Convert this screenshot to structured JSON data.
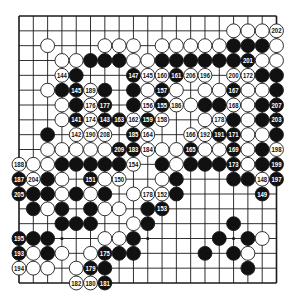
{
  "diagram": {
    "type": "go-board-kifu",
    "size": 19,
    "colors": {
      "board": "#ffffff",
      "line": "#1a1a1a",
      "black": "#111111",
      "white": "#ffffff"
    },
    "star_points": [
      [
        3,
        3
      ],
      [
        3,
        9
      ],
      [
        3,
        15
      ],
      [
        9,
        3
      ],
      [
        9,
        9
      ],
      [
        9,
        15
      ],
      [
        15,
        3
      ],
      [
        15,
        9
      ],
      [
        15,
        15
      ]
    ],
    "stones": [
      {
        "r": 1,
        "c": 15,
        "color": "W"
      },
      {
        "r": 1,
        "c": 16,
        "color": "W"
      },
      {
        "r": 1,
        "c": 17,
        "color": "W"
      },
      {
        "r": 1,
        "c": 18,
        "color": "W",
        "n": "202"
      },
      {
        "r": 2,
        "c": 2,
        "color": "W"
      },
      {
        "r": 2,
        "c": 6,
        "color": "W"
      },
      {
        "r": 2,
        "c": 7,
        "color": "W"
      },
      {
        "r": 2,
        "c": 8,
        "color": "W"
      },
      {
        "r": 2,
        "c": 10,
        "color": "W"
      },
      {
        "r": 2,
        "c": 11,
        "color": "W"
      },
      {
        "r": 2,
        "c": 12,
        "color": "W"
      },
      {
        "r": 2,
        "c": 13,
        "color": "W"
      },
      {
        "r": 2,
        "c": 14,
        "color": "W"
      },
      {
        "r": 2,
        "c": 15,
        "color": "B"
      },
      {
        "r": 2,
        "c": 16,
        "color": "B"
      },
      {
        "r": 2,
        "c": 17,
        "color": "B"
      },
      {
        "r": 2,
        "c": 18,
        "color": "W"
      },
      {
        "r": 3,
        "c": 3,
        "color": "W"
      },
      {
        "r": 3,
        "c": 4,
        "color": "W"
      },
      {
        "r": 3,
        "c": 5,
        "color": "B"
      },
      {
        "r": 3,
        "c": 6,
        "color": "B"
      },
      {
        "r": 3,
        "c": 7,
        "color": "B"
      },
      {
        "r": 3,
        "c": 8,
        "color": "W"
      },
      {
        "r": 3,
        "c": 9,
        "color": "W"
      },
      {
        "r": 3,
        "c": 10,
        "color": "B"
      },
      {
        "r": 3,
        "c": 11,
        "color": "B"
      },
      {
        "r": 3,
        "c": 12,
        "color": "B"
      },
      {
        "r": 3,
        "c": 13,
        "color": "B"
      },
      {
        "r": 3,
        "c": 14,
        "color": "B"
      },
      {
        "r": 3,
        "c": 15,
        "color": "B"
      },
      {
        "r": 3,
        "c": 16,
        "color": "B",
        "n": "201"
      },
      {
        "r": 3,
        "c": 17,
        "color": "W"
      },
      {
        "r": 3,
        "c": 18,
        "color": "W"
      },
      {
        "r": 4,
        "c": 3,
        "color": "W",
        "n": "144"
      },
      {
        "r": 4,
        "c": 4,
        "color": "B"
      },
      {
        "r": 4,
        "c": 8,
        "color": "B",
        "n": "147"
      },
      {
        "r": 4,
        "c": 9,
        "color": "W",
        "n": "145"
      },
      {
        "r": 4,
        "c": 10,
        "color": "W",
        "n": "160"
      },
      {
        "r": 4,
        "c": 11,
        "color": "B",
        "n": "161"
      },
      {
        "r": 4,
        "c": 12,
        "color": "W",
        "n": "206"
      },
      {
        "r": 4,
        "c": 13,
        "color": "W",
        "n": "196"
      },
      {
        "r": 4,
        "c": 15,
        "color": "W",
        "n": "200"
      },
      {
        "r": 4,
        "c": 16,
        "color": "W",
        "n": "172"
      },
      {
        "r": 4,
        "c": 17,
        "color": "B"
      },
      {
        "r": 4,
        "c": 18,
        "color": "B"
      },
      {
        "r": 5,
        "c": 2,
        "color": "W"
      },
      {
        "r": 5,
        "c": 3,
        "color": "B"
      },
      {
        "r": 5,
        "c": 4,
        "color": "B",
        "n": "145"
      },
      {
        "r": 5,
        "c": 5,
        "color": "W",
        "n": "189"
      },
      {
        "r": 5,
        "c": 6,
        "color": "B"
      },
      {
        "r": 5,
        "c": 8,
        "color": "B"
      },
      {
        "r": 5,
        "c": 9,
        "color": "W"
      },
      {
        "r": 5,
        "c": 10,
        "color": "B",
        "n": "157"
      },
      {
        "r": 5,
        "c": 11,
        "color": "W"
      },
      {
        "r": 5,
        "c": 13,
        "color": "W"
      },
      {
        "r": 5,
        "c": 14,
        "color": "W"
      },
      {
        "r": 5,
        "c": 15,
        "color": "B",
        "n": "167"
      },
      {
        "r": 5,
        "c": 16,
        "color": "W"
      },
      {
        "r": 5,
        "c": 17,
        "color": "W"
      },
      {
        "r": 5,
        "c": 18,
        "color": "B"
      },
      {
        "r": 6,
        "c": 3,
        "color": "W"
      },
      {
        "r": 6,
        "c": 4,
        "color": "B"
      },
      {
        "r": 6,
        "c": 5,
        "color": "W",
        "n": "176"
      },
      {
        "r": 6,
        "c": 6,
        "color": "B",
        "n": "177"
      },
      {
        "r": 6,
        "c": 8,
        "color": "B"
      },
      {
        "r": 6,
        "c": 9,
        "color": "W",
        "n": "156"
      },
      {
        "r": 6,
        "c": 10,
        "color": "B",
        "n": "155"
      },
      {
        "r": 6,
        "c": 11,
        "color": "W",
        "n": "186"
      },
      {
        "r": 6,
        "c": 12,
        "color": "W"
      },
      {
        "r": 6,
        "c": 13,
        "color": "B"
      },
      {
        "r": 6,
        "c": 14,
        "color": "B"
      },
      {
        "r": 6,
        "c": 15,
        "color": "W",
        "n": "168"
      },
      {
        "r": 6,
        "c": 16,
        "color": "W"
      },
      {
        "r": 6,
        "c": 17,
        "color": "B"
      },
      {
        "r": 6,
        "c": 18,
        "color": "B",
        "n": "207"
      },
      {
        "r": 7,
        "c": 3,
        "color": "W"
      },
      {
        "r": 7,
        "c": 4,
        "color": "B",
        "n": "141"
      },
      {
        "r": 7,
        "c": 5,
        "color": "W",
        "n": "174"
      },
      {
        "r": 7,
        "c": 6,
        "color": "B",
        "n": "143"
      },
      {
        "r": 7,
        "c": 7,
        "color": "B",
        "n": "163"
      },
      {
        "r": 7,
        "c": 8,
        "color": "W",
        "n": "162"
      },
      {
        "r": 7,
        "c": 9,
        "color": "B",
        "n": "159"
      },
      {
        "r": 7,
        "c": 10,
        "color": "W",
        "n": "158"
      },
      {
        "r": 7,
        "c": 13,
        "color": "W"
      },
      {
        "r": 7,
        "c": 14,
        "color": "W",
        "n": "178"
      },
      {
        "r": 7,
        "c": 15,
        "color": "B"
      },
      {
        "r": 7,
        "c": 16,
        "color": "W"
      },
      {
        "r": 7,
        "c": 17,
        "color": "B"
      },
      {
        "r": 7,
        "c": 18,
        "color": "B",
        "n": "203"
      },
      {
        "r": 8,
        "c": 2,
        "color": "B"
      },
      {
        "r": 8,
        "c": 4,
        "color": "W",
        "n": "142"
      },
      {
        "r": 8,
        "c": 5,
        "color": "W",
        "n": "190"
      },
      {
        "r": 8,
        "c": 6,
        "color": "W",
        "n": "208"
      },
      {
        "r": 8,
        "c": 8,
        "color": "B",
        "n": "185"
      },
      {
        "r": 8,
        "c": 9,
        "color": "W",
        "n": "164"
      },
      {
        "r": 8,
        "c": 12,
        "color": "W",
        "n": "166"
      },
      {
        "r": 8,
        "c": 13,
        "color": "W",
        "n": "192"
      },
      {
        "r": 8,
        "c": 14,
        "color": "B",
        "n": "191"
      },
      {
        "r": 8,
        "c": 15,
        "color": "B",
        "n": "171"
      },
      {
        "r": 8,
        "c": 16,
        "color": "W"
      },
      {
        "r": 8,
        "c": 17,
        "color": "W"
      },
      {
        "r": 8,
        "c": 18,
        "color": "B"
      },
      {
        "r": 9,
        "c": 2,
        "color": "W"
      },
      {
        "r": 9,
        "c": 3,
        "color": "W"
      },
      {
        "r": 9,
        "c": 4,
        "color": "W"
      },
      {
        "r": 9,
        "c": 5,
        "color": "W"
      },
      {
        "r": 9,
        "c": 6,
        "color": "W"
      },
      {
        "r": 9,
        "c": 7,
        "color": "B",
        "n": "209"
      },
      {
        "r": 9,
        "c": 8,
        "color": "B",
        "n": "183"
      },
      {
        "r": 9,
        "c": 9,
        "color": "W",
        "n": "184"
      },
      {
        "r": 9,
        "c": 10,
        "color": "W"
      },
      {
        "r": 9,
        "c": 11,
        "color": "W"
      },
      {
        "r": 9,
        "c": 12,
        "color": "B",
        "n": "165"
      },
      {
        "r": 9,
        "c": 13,
        "color": "W"
      },
      {
        "r": 9,
        "c": 14,
        "color": "W"
      },
      {
        "r": 9,
        "c": 15,
        "color": "B",
        "n": "169"
      },
      {
        "r": 9,
        "c": 16,
        "color": "W"
      },
      {
        "r": 9,
        "c": 17,
        "color": "B"
      },
      {
        "r": 9,
        "c": 18,
        "color": "W",
        "n": "198"
      },
      {
        "r": 10,
        "c": 0,
        "color": "W",
        "n": "188"
      },
      {
        "r": 10,
        "c": 1,
        "color": "W"
      },
      {
        "r": 10,
        "c": 2,
        "color": "W"
      },
      {
        "r": 10,
        "c": 3,
        "color": "B"
      },
      {
        "r": 10,
        "c": 4,
        "color": "B"
      },
      {
        "r": 10,
        "c": 5,
        "color": "B"
      },
      {
        "r": 10,
        "c": 6,
        "color": "B"
      },
      {
        "r": 10,
        "c": 7,
        "color": "B"
      },
      {
        "r": 10,
        "c": 8,
        "color": "W",
        "n": "154"
      },
      {
        "r": 10,
        "c": 10,
        "color": "B"
      },
      {
        "r": 10,
        "c": 11,
        "color": "W"
      },
      {
        "r": 10,
        "c": 12,
        "color": "B"
      },
      {
        "r": 10,
        "c": 13,
        "color": "B"
      },
      {
        "r": 10,
        "c": 14,
        "color": "B"
      },
      {
        "r": 10,
        "c": 15,
        "color": "B",
        "n": "173"
      },
      {
        "r": 10,
        "c": 16,
        "color": "W"
      },
      {
        "r": 10,
        "c": 17,
        "color": "B"
      },
      {
        "r": 10,
        "c": 18,
        "color": "B",
        "n": "199"
      },
      {
        "r": 11,
        "c": 0,
        "color": "B",
        "n": "187"
      },
      {
        "r": 11,
        "c": 1,
        "color": "W",
        "n": "204"
      },
      {
        "r": 11,
        "c": 2,
        "color": "B"
      },
      {
        "r": 11,
        "c": 3,
        "color": "W"
      },
      {
        "r": 11,
        "c": 5,
        "color": "B",
        "n": "151"
      },
      {
        "r": 11,
        "c": 6,
        "color": "W"
      },
      {
        "r": 11,
        "c": 7,
        "color": "W",
        "n": "150"
      },
      {
        "r": 11,
        "c": 10,
        "color": "W"
      },
      {
        "r": 11,
        "c": 11,
        "color": "B"
      },
      {
        "r": 11,
        "c": 15,
        "color": "B"
      },
      {
        "r": 11,
        "c": 16,
        "color": "B"
      },
      {
        "r": 11,
        "c": 17,
        "color": "W",
        "n": "148"
      },
      {
        "r": 11,
        "c": 18,
        "color": "B",
        "n": "197"
      },
      {
        "r": 12,
        "c": 0,
        "color": "B",
        "n": "205"
      },
      {
        "r": 12,
        "c": 1,
        "color": "B"
      },
      {
        "r": 12,
        "c": 2,
        "color": "B"
      },
      {
        "r": 12,
        "c": 3,
        "color": "W"
      },
      {
        "r": 12,
        "c": 4,
        "color": "B"
      },
      {
        "r": 12,
        "c": 5,
        "color": "W"
      },
      {
        "r": 12,
        "c": 6,
        "color": "B"
      },
      {
        "r": 12,
        "c": 8,
        "color": "W"
      },
      {
        "r": 12,
        "c": 9,
        "color": "W",
        "n": "178"
      },
      {
        "r": 12,
        "c": 10,
        "color": "W",
        "n": "152"
      },
      {
        "r": 12,
        "c": 11,
        "color": "B"
      },
      {
        "r": 12,
        "c": 17,
        "color": "B",
        "n": "149"
      },
      {
        "r": 13,
        "c": 1,
        "color": "B"
      },
      {
        "r": 13,
        "c": 2,
        "color": "W"
      },
      {
        "r": 13,
        "c": 3,
        "color": "B"
      },
      {
        "r": 13,
        "c": 5,
        "color": "B"
      },
      {
        "r": 13,
        "c": 6,
        "color": "W"
      },
      {
        "r": 13,
        "c": 7,
        "color": "W"
      },
      {
        "r": 13,
        "c": 9,
        "color": "B"
      },
      {
        "r": 13,
        "c": 10,
        "color": "B",
        "n": "153"
      },
      {
        "r": 14,
        "c": 3,
        "color": "B"
      },
      {
        "r": 14,
        "c": 4,
        "color": "B"
      },
      {
        "r": 14,
        "c": 5,
        "color": "B"
      },
      {
        "r": 14,
        "c": 8,
        "color": "W"
      },
      {
        "r": 14,
        "c": 9,
        "color": "B"
      },
      {
        "r": 14,
        "c": 15,
        "color": "B"
      },
      {
        "r": 15,
        "c": 0,
        "color": "B",
        "n": "195"
      },
      {
        "r": 15,
        "c": 1,
        "color": "B"
      },
      {
        "r": 15,
        "c": 2,
        "color": "B"
      },
      {
        "r": 15,
        "c": 6,
        "color": "W"
      },
      {
        "r": 15,
        "c": 7,
        "color": "W"
      },
      {
        "r": 15,
        "c": 8,
        "color": "B"
      },
      {
        "r": 15,
        "c": 14,
        "color": "B"
      },
      {
        "r": 15,
        "c": 16,
        "color": "B"
      },
      {
        "r": 15,
        "c": 17,
        "color": "W"
      },
      {
        "r": 16,
        "c": 0,
        "color": "B",
        "n": "193"
      },
      {
        "r": 16,
        "c": 1,
        "color": "W"
      },
      {
        "r": 16,
        "c": 2,
        "color": "B"
      },
      {
        "r": 16,
        "c": 3,
        "color": "W"
      },
      {
        "r": 16,
        "c": 5,
        "color": "W"
      },
      {
        "r": 16,
        "c": 6,
        "color": "B",
        "n": "175"
      },
      {
        "r": 16,
        "c": 7,
        "color": "B"
      },
      {
        "r": 16,
        "c": 8,
        "color": "B"
      },
      {
        "r": 16,
        "c": 13,
        "color": "B"
      },
      {
        "r": 16,
        "c": 15,
        "color": "B"
      },
      {
        "r": 16,
        "c": 16,
        "color": "W"
      },
      {
        "r": 17,
        "c": 0,
        "color": "W",
        "n": "194"
      },
      {
        "r": 17,
        "c": 1,
        "color": "W"
      },
      {
        "r": 17,
        "c": 2,
        "color": "W"
      },
      {
        "r": 17,
        "c": 4,
        "color": "W"
      },
      {
        "r": 17,
        "c": 5,
        "color": "B",
        "n": "179"
      },
      {
        "r": 17,
        "c": 6,
        "color": "B"
      },
      {
        "r": 17,
        "c": 16,
        "color": "B"
      },
      {
        "r": 18,
        "c": 4,
        "color": "W",
        "n": "182"
      },
      {
        "r": 18,
        "c": 5,
        "color": "W",
        "n": "180"
      },
      {
        "r": 18,
        "c": 6,
        "color": "B",
        "n": "181"
      }
    ]
  }
}
